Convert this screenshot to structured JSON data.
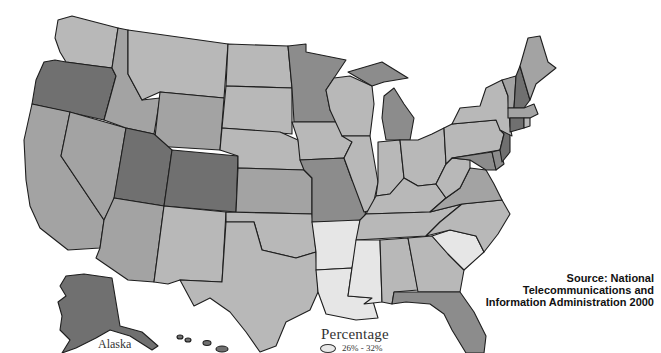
{
  "map": {
    "type": "choropleth",
    "region": "United States",
    "colors": {
      "lightest": "#e6e6e6",
      "light": "#b8b8b8",
      "medium": "#a3a3a3",
      "dark": "#8c8c8c",
      "darkest": "#707070",
      "outline": "#1e1e1e"
    },
    "state_shading": {
      "WA": "light",
      "OR": "darkest",
      "CA": "medium",
      "NV": "medium",
      "ID": "medium",
      "MT": "light",
      "WY": "medium",
      "UT": "darkest",
      "CO": "darkest",
      "AZ": "medium",
      "NM": "light",
      "ND": "light",
      "SD": "light",
      "NE": "light",
      "KS": "medium",
      "OK": "light",
      "TX": "light",
      "MN": "dark",
      "IA": "light",
      "MO": "dark",
      "AR": "lightest",
      "LA": "lightest",
      "WI": "light",
      "IL": "light",
      "MI": "dark",
      "IN": "light",
      "OH": "light",
      "KY": "light",
      "TN": "light",
      "MS": "lightest",
      "AL": "light",
      "GA": "light",
      "FL": "dark",
      "SC": "lightest",
      "NC": "light",
      "VA": "medium",
      "WV": "light",
      "PA": "light",
      "NY": "light",
      "VT": "medium",
      "NH": "darkest",
      "ME": "medium",
      "MA": "medium",
      "CT": "darkest",
      "RI": "light",
      "NJ": "darkest",
      "DE": "dark",
      "MD": "dark",
      "AK": "darkest",
      "HI": "darkest"
    },
    "alaska_label": "Alaska"
  },
  "legend": {
    "title": "Percentage",
    "entries": [
      {
        "label": "26% - 32%",
        "color": "#e8e8e8"
      }
    ]
  },
  "source": {
    "line1": "Source:  National",
    "line2": "Telecommunications and",
    "line3": "Information Administration 2000"
  }
}
